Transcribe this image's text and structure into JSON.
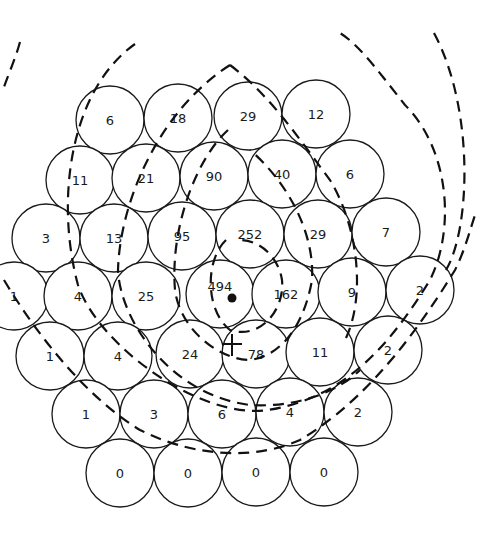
{
  "diagram": {
    "type": "hexagonal-cell-array-with-isocontours",
    "cell_radius": 34,
    "cells": [
      {
        "x": 110,
        "y": 120,
        "label": "6"
      },
      {
        "x": 178,
        "y": 118,
        "label": "18"
      },
      {
        "x": 248,
        "y": 116,
        "label": "29"
      },
      {
        "x": 316,
        "y": 114,
        "label": "12"
      },
      {
        "x": 80,
        "y": 180,
        "label": "11"
      },
      {
        "x": 146,
        "y": 178,
        "label": "21"
      },
      {
        "x": 214,
        "y": 176,
        "label": "90"
      },
      {
        "x": 282,
        "y": 174,
        "label": "40"
      },
      {
        "x": 350,
        "y": 174,
        "label": "6"
      },
      {
        "x": 46,
        "y": 238,
        "label": "3"
      },
      {
        "x": 114,
        "y": 238,
        "label": "13"
      },
      {
        "x": 182,
        "y": 236,
        "label": "95"
      },
      {
        "x": 250,
        "y": 234,
        "label": "252"
      },
      {
        "x": 318,
        "y": 234,
        "label": "29"
      },
      {
        "x": 386,
        "y": 232,
        "label": "7"
      },
      {
        "x": 14,
        "y": 296,
        "label": "1"
      },
      {
        "x": 78,
        "y": 296,
        "label": "4"
      },
      {
        "x": 146,
        "y": 296,
        "label": "25"
      },
      {
        "x": 220,
        "y": 294,
        "label": "494"
      },
      {
        "x": 286,
        "y": 294,
        "label": "162"
      },
      {
        "x": 352,
        "y": 292,
        "label": "9"
      },
      {
        "x": 420,
        "y": 290,
        "label": "2"
      },
      {
        "x": 50,
        "y": 356,
        "label": "1"
      },
      {
        "x": 118,
        "y": 356,
        "label": "4"
      },
      {
        "x": 190,
        "y": 354,
        "label": "24"
      },
      {
        "x": 256,
        "y": 354,
        "label": "78"
      },
      {
        "x": 320,
        "y": 352,
        "label": "11"
      },
      {
        "x": 388,
        "y": 350,
        "label": "2"
      },
      {
        "x": 86,
        "y": 414,
        "label": "1"
      },
      {
        "x": 154,
        "y": 414,
        "label": "3"
      },
      {
        "x": 222,
        "y": 414,
        "label": "6"
      },
      {
        "x": 290,
        "y": 412,
        "label": "4"
      },
      {
        "x": 358,
        "y": 412,
        "label": "2"
      },
      {
        "x": 120,
        "y": 473,
        "label": "0"
      },
      {
        "x": 188,
        "y": 473,
        "label": "0"
      },
      {
        "x": 256,
        "y": 472,
        "label": "0"
      },
      {
        "x": 324,
        "y": 472,
        "label": "0"
      }
    ],
    "peak_marker": {
      "x": 232,
      "y": 298,
      "symbol": "dot"
    },
    "cross_marker": {
      "x": 232,
      "y": 344,
      "symbol": "plus"
    }
  }
}
